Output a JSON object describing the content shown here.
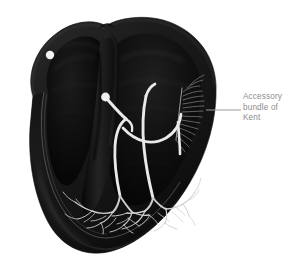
{
  "figure": {
    "name": "heart-conduction-system-illustration",
    "background_color": "#ffffff"
  },
  "callout": {
    "label_lines": [
      "Accessory",
      "bundle of",
      "Kent"
    ],
    "full_text": "Accessory bundle of Kent",
    "text_color": "#8d8d8d",
    "leader_line_color": "#9a9a9a"
  },
  "anatomy": {
    "myocardium_fill": "#111111",
    "myocardium_outer_edge": "#2e2e2e",
    "cavity_fill": "#060606",
    "endocardium_highlight": "#3a3a3a",
    "septum_shade": "#1a1a1a",
    "parts": [
      {
        "name": "sinoatrial-node",
        "label": "sinoatrial node marker",
        "color": "#f2f2f2",
        "cx": 50,
        "cy": 55,
        "r": 4.2
      },
      {
        "name": "atrioventricular-node",
        "label": "atrioventricular node marker",
        "color": "#ededed",
        "cx": 105.5,
        "cy": 97,
        "r": 4.4
      },
      {
        "name": "bundle-of-his",
        "label": "bundle of His",
        "color": "#e8e8e8"
      },
      {
        "name": "left-bundle-branch",
        "label": "left bundle branch",
        "color": "#e8e8e8"
      },
      {
        "name": "right-bundle-branch",
        "label": "right bundle branch",
        "color": "#e8e8e8"
      },
      {
        "name": "accessory-bundle-of-kent",
        "label": "accessory bundle of Kent",
        "color": "#e8e8e8"
      },
      {
        "name": "purkinje-fibers-left",
        "label": "left Purkinje fiber network",
        "color": "#cfcfcf"
      },
      {
        "name": "purkinje-fibers-right",
        "label": "right Purkinje fiber network",
        "color": "#cfcfcf"
      },
      {
        "name": "lateral-wall-fiber-fan",
        "label": "lateral wall conduction fiber fan",
        "color": "#bdbdbd"
      }
    ]
  }
}
